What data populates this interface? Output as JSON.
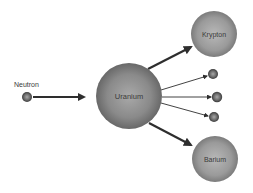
{
  "diagram": {
    "type": "nuclear-fission",
    "nodes": {
      "incoming_neutron": {
        "label": "Neutron",
        "cx": 27,
        "cy": 97,
        "r": 5
      },
      "uranium": {
        "label": "Uranium",
        "cx": 129,
        "cy": 96,
        "r": 33
      },
      "krypton": {
        "label": "Krypton",
        "cx": 214,
        "cy": 34,
        "r": 23
      },
      "barium": {
        "label": "Barium",
        "cx": 215,
        "cy": 159,
        "r": 23
      },
      "released_neutrons": [
        {
          "cx": 213,
          "cy": 74,
          "r": 5
        },
        {
          "cx": 217,
          "cy": 97,
          "r": 5
        },
        {
          "cx": 214,
          "cy": 117,
          "r": 5
        }
      ]
    },
    "edges": [
      {
        "from": "incoming_neutron",
        "to": "uranium",
        "weight": "medium"
      },
      {
        "from": "uranium",
        "to": "krypton",
        "weight": "thick"
      },
      {
        "from": "uranium",
        "to": "barium",
        "weight": "thick"
      },
      {
        "from": "uranium",
        "to": "released_neutron_1",
        "weight": "thin"
      },
      {
        "from": "uranium",
        "to": "released_neutron_2",
        "weight": "thin"
      },
      {
        "from": "uranium",
        "to": "released_neutron_3",
        "weight": "thin"
      }
    ],
    "colors": {
      "background": "#ffffff",
      "arrow": "#2e2e2e",
      "sphere_light": "#b5b5b5",
      "sphere_dark": "#5a5a5a",
      "text": "#3a3a3a"
    }
  }
}
